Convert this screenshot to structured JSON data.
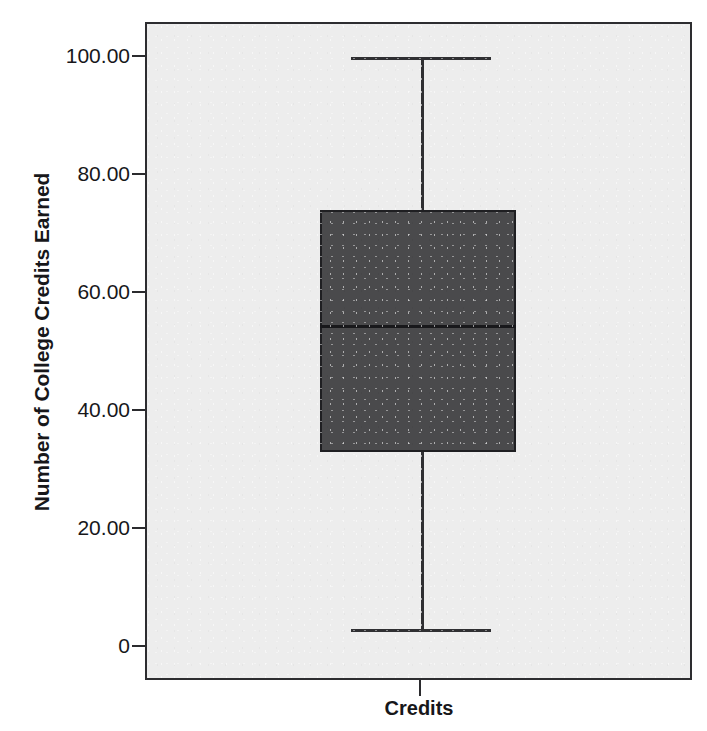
{
  "chart_data": {
    "type": "box",
    "title": "",
    "xlabel": "",
    "ylabel": "Number of College Credits Earned",
    "categories": [
      "Credits"
    ],
    "ylim": [
      0,
      105
    ],
    "grid": false,
    "legend": "none",
    "y_ticks": [
      {
        "value": 100,
        "label": "100.00"
      },
      {
        "value": 80,
        "label": "80.00"
      },
      {
        "value": 60,
        "label": "60.00"
      },
      {
        "value": 40,
        "label": "40.00"
      },
      {
        "value": 20,
        "label": "20.00"
      },
      {
        "value": 0,
        "label": "0"
      }
    ],
    "x_ticks": [
      {
        "label": "Credits"
      }
    ],
    "series": [
      {
        "name": "Credits",
        "whisker_low": 3,
        "q1": 33,
        "median": 54.5,
        "q3": 74,
        "whisker_high": 100,
        "outliers": []
      }
    ],
    "colors": {
      "box_fill": "#4a4a4c",
      "box_border": "#1f1f22",
      "median": "#18181b",
      "whisker": "#2f2f32",
      "plot_background": "#ededed",
      "axis": "#2d2d30",
      "text": "#17171a",
      "page_background": "#ffffff"
    }
  },
  "axes": {
    "y_title": "Number of College Credits Earned",
    "y_tick_labels": [
      "100.00",
      "80.00",
      "60.00",
      "40.00",
      "20.00",
      "0"
    ],
    "x_tick_labels": [
      "Credits"
    ]
  }
}
